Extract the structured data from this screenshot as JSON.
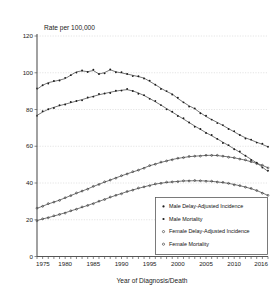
{
  "chart_data": {
    "type": "line",
    "title": "",
    "ylabel": "Rate per 100,000",
    "xlabel": "Year of Diagnosis/Death",
    "ylim": [
      0,
      120
    ],
    "xlim": [
      1975,
      2016
    ],
    "yticks": [
      0,
      20,
      40,
      60,
      80,
      100,
      120
    ],
    "xticks": [
      1975,
      1980,
      1985,
      1990,
      1995,
      2000,
      2005,
      2010,
      2016
    ],
    "grid": true,
    "legend_position": "bottom-right",
    "x": [
      1975,
      1976,
      1977,
      1978,
      1979,
      1980,
      1981,
      1982,
      1983,
      1984,
      1985,
      1986,
      1987,
      1988,
      1989,
      1990,
      1991,
      1992,
      1993,
      1994,
      1995,
      1996,
      1997,
      1998,
      1999,
      2000,
      2001,
      2002,
      2003,
      2004,
      2005,
      2006,
      2007,
      2008,
      2009,
      2010,
      2011,
      2012,
      2013,
      2014,
      2015,
      2016
    ],
    "series": [
      {
        "name": "Male Delay-Adjusted Incidence",
        "marker": "filled",
        "values": [
          91.0,
          93.2,
          94.6,
          95.3,
          96.0,
          96.8,
          98.7,
          100.5,
          101.0,
          100.6,
          101.2,
          99.3,
          100.1,
          101.6,
          100.5,
          99.9,
          99.3,
          98.6,
          97.9,
          97.1,
          95.3,
          93.5,
          91.6,
          89.8,
          88.4,
          86.0,
          83.9,
          82.0,
          80.4,
          78.2,
          76.2,
          74.5,
          73.0,
          71.3,
          69.6,
          67.8,
          66.1,
          64.6,
          63.4,
          62.2,
          61.0,
          59.7
        ]
      },
      {
        "name": "Male Mortality",
        "marker": "filled",
        "values": [
          76.8,
          78.6,
          80.1,
          81.2,
          82.1,
          82.9,
          83.7,
          84.6,
          85.4,
          86.3,
          87.2,
          88.0,
          88.7,
          89.4,
          90.0,
          90.5,
          90.8,
          90.1,
          89.0,
          87.6,
          86.0,
          84.2,
          82.4,
          80.5,
          78.6,
          76.7,
          74.8,
          72.9,
          71.0,
          69.2,
          67.4,
          65.7,
          64.0,
          62.2,
          60.4,
          58.6,
          56.7,
          54.8,
          52.9,
          50.9,
          48.6,
          46.3
        ]
      },
      {
        "name": "Female Delay-Adjusted Incidence",
        "marker": "open",
        "values": [
          26.2,
          27.4,
          28.6,
          29.6,
          30.7,
          31.9,
          33.2,
          34.4,
          35.6,
          36.8,
          38.1,
          39.3,
          40.5,
          41.6,
          42.8,
          43.9,
          45.0,
          46.0,
          47.0,
          48.2,
          49.4,
          50.3,
          51.2,
          52.0,
          52.8,
          53.4,
          53.9,
          54.3,
          54.6,
          54.8,
          55.0,
          55.1,
          54.9,
          54.6,
          54.2,
          53.7,
          53.1,
          52.4,
          51.6,
          50.7,
          49.6,
          48.3
        ]
      },
      {
        "name": "Female Mortality",
        "marker": "open",
        "values": [
          19.6,
          20.4,
          21.2,
          22.0,
          22.9,
          23.8,
          24.8,
          25.8,
          26.8,
          27.8,
          28.9,
          30.0,
          31.1,
          32.2,
          33.3,
          34.3,
          35.3,
          36.2,
          37.1,
          37.9,
          38.7,
          39.4,
          39.9,
          40.3,
          40.6,
          40.9,
          41.1,
          41.2,
          41.2,
          41.2,
          41.1,
          40.9,
          40.6,
          40.2,
          39.8,
          39.2,
          38.5,
          37.8,
          36.9,
          35.9,
          34.6,
          33.2
        ]
      }
    ]
  },
  "axis": {
    "ylabel": "Rate per 100,000",
    "xlabel": "Year of Diagnosis/Death"
  },
  "legend": {
    "items": [
      {
        "label": "Male Delay-Adjusted Incidence",
        "marker": "filled"
      },
      {
        "label": "Male Mortality",
        "marker": "filled"
      },
      {
        "label": "Female Delay-Adjusted Incidence",
        "marker": "open"
      },
      {
        "label": "Female Mortality",
        "marker": "open"
      }
    ]
  },
  "colors": {
    "line": "#4a4a4a",
    "marker": "#1b1b1b",
    "grid": "#c9c9c9",
    "axis": "#555555",
    "background": "#ffffff"
  }
}
